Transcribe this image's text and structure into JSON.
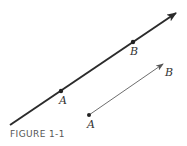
{
  "figure": {
    "caption": "FIGURE 1-1",
    "line": {
      "description": "line through points A and B",
      "points": [
        {
          "label": "A"
        },
        {
          "label": "B"
        }
      ]
    },
    "vector": {
      "description": "directed segment from A to B",
      "start_label": "A",
      "end_label": "B"
    }
  },
  "colors": {
    "line": "#2b2b2b",
    "vector": "#6e6e6e",
    "background": "#ffffff"
  }
}
